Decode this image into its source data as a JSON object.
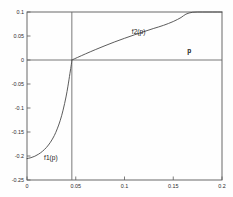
{
  "chart_data": {
    "type": "line",
    "title": "",
    "xlabel": "p",
    "ylabel": "",
    "xlim": [
      0,
      0.2
    ],
    "ylim": [
      -0.25,
      0.1
    ],
    "grid": false,
    "legend_position": "inline-annotation",
    "xticks": [
      "0",
      "0.05",
      "0.1",
      "0.15",
      "0.2"
    ],
    "xtick_values": [
      0,
      0.05,
      0.1,
      0.15,
      0.2
    ],
    "yticks": [
      "0.1",
      "0.05",
      "0",
      "-0.05",
      "-0.1",
      "-0.15",
      "-0.2",
      "-0.25"
    ],
    "ytick_values": [
      0.1,
      0.05,
      0,
      -0.05,
      -0.1,
      -0.15,
      -0.2,
      -0.25
    ],
    "root_p": 0.046,
    "reference_lines": [
      {
        "name": "zero-horizontal",
        "orientation": "horizontal",
        "value": 0
      },
      {
        "name": "root-vertical",
        "orientation": "vertical",
        "value": 0.046
      }
    ],
    "annotations": [
      {
        "name": "f1-label",
        "text": "f1(p)",
        "x": 0.0175,
        "y": -0.2085
      },
      {
        "name": "f2-label",
        "text": "f2(p)",
        "x": 0.1075,
        "y": 0.0545
      },
      {
        "name": "p-axis-label",
        "text": "p",
        "x": 0.1665,
        "y": 0.0155
      }
    ],
    "series": [
      {
        "name": "f1(p)",
        "x": [
          0,
          0.004,
          0.008,
          0.012,
          0.016,
          0.02,
          0.024,
          0.028,
          0.031,
          0.034,
          0.037,
          0.04,
          0.042,
          0.044,
          0.0455,
          0.046
        ],
        "values": [
          -0.2055,
          -0.2035,
          -0.2005,
          -0.196,
          -0.19,
          -0.182,
          -0.1715,
          -0.1575,
          -0.1435,
          -0.1265,
          -0.1045,
          -0.077,
          -0.0545,
          -0.0285,
          -0.009,
          0
        ]
      },
      {
        "name": "f2(p)",
        "x": [
          0.046,
          0.052,
          0.06,
          0.07,
          0.08,
          0.09,
          0.1,
          0.11,
          0.12,
          0.13,
          0.14,
          0.15,
          0.158,
          0.163,
          0.17,
          0.18,
          0.19,
          0.2
        ],
        "values": [
          0,
          0.0055,
          0.0128,
          0.0215,
          0.0298,
          0.0378,
          0.0452,
          0.0523,
          0.0592,
          0.0658,
          0.0722,
          0.0802,
          0.0885,
          0.0955,
          0.0995,
          0.1,
          0.1,
          0.1
        ]
      }
    ]
  },
  "figure": {
    "background_color": "#fefefe",
    "axis_color": "#5a5a5a",
    "curve_color": "#4a4a4a"
  }
}
